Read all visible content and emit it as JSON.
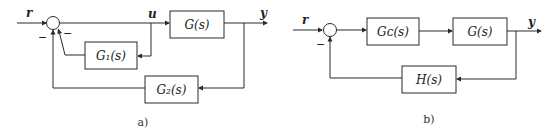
{
  "diagrams": {
    "a": {
      "caption": "a)",
      "input_label": "r",
      "control_label": "u",
      "output_label": "y",
      "forward_block": "G(s)",
      "inner_feedback_block": "G₁(s)",
      "outer_feedback_block": "G₂(s)",
      "summing_junction_signs": [
        "−",
        "−"
      ]
    },
    "b": {
      "caption": "b)",
      "input_label": "r",
      "output_label": "y",
      "controller_block": "Gᴄ(s)",
      "plant_block": "G(s)",
      "feedback_block": "H(s)",
      "summing_junction_signs": [
        "−"
      ]
    }
  }
}
